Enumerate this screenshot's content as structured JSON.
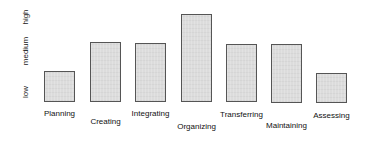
{
  "chart_data": {
    "type": "bar",
    "title": "",
    "xlabel": "",
    "ylabel": "",
    "y_scale": "qualitative",
    "yticks": [
      "low",
      "medium",
      "high"
    ],
    "ylim": [
      0,
      3
    ],
    "grid": false,
    "legend": null,
    "categories": [
      "Planning",
      "Creating",
      "Integrating",
      "Organizing",
      "Transferring",
      "Maintaining",
      "Assessing"
    ],
    "values": [
      1.5,
      2.1,
      2.1,
      3.0,
      2.05,
      2.05,
      1.4
    ],
    "bar_color": "#dcdcdc",
    "bar_edge_color": "#555555"
  },
  "axis": {
    "y_labels": [
      {
        "text": "high"
      },
      {
        "text": "medium"
      },
      {
        "text": "low"
      }
    ]
  },
  "bars": [
    {
      "label": "Planning",
      "left": 44,
      "top": 71,
      "width": 31,
      "height": 31,
      "label_top": 109
    },
    {
      "label": "Creating",
      "left": 90,
      "top": 42,
      "width": 31,
      "height": 60,
      "label_top": 117
    },
    {
      "label": "Integrating",
      "left": 135,
      "top": 43,
      "width": 31,
      "height": 59,
      "label_top": 109
    },
    {
      "label": "Organizing",
      "left": 181,
      "top": 14,
      "width": 31,
      "height": 88,
      "label_top": 122
    },
    {
      "label": "Transferring",
      "left": 226,
      "top": 44,
      "width": 31,
      "height": 58,
      "label_top": 110
    },
    {
      "label": "Maintaining",
      "left": 271,
      "top": 44,
      "width": 31,
      "height": 59,
      "label_top": 121
    },
    {
      "label": "Assessing",
      "left": 316,
      "top": 73,
      "width": 31,
      "height": 30,
      "label_top": 111
    }
  ]
}
